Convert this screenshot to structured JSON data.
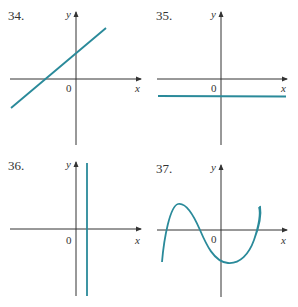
{
  "figures": [
    {
      "number": "34.",
      "x_label": "x",
      "y_label": "y",
      "origin_label": "0",
      "description": "straight line with positive slope, positive y-intercept, negative x-intercept"
    },
    {
      "number": "35.",
      "x_label": "x",
      "y_label": "y",
      "origin_label": "0",
      "description": "horizontal line below the x-axis"
    },
    {
      "number": "36.",
      "x_label": "x",
      "y_label": "y",
      "origin_label": "0",
      "description": "vertical line slightly right of the y-axis"
    },
    {
      "number": "37.",
      "x_label": "x",
      "y_label": "y",
      "origin_label": "0",
      "description": "cubic-shaped curve with local max left of origin and local min right of origin"
    }
  ],
  "colors": {
    "curve": "#2a8a9a",
    "axis": "#333333"
  }
}
